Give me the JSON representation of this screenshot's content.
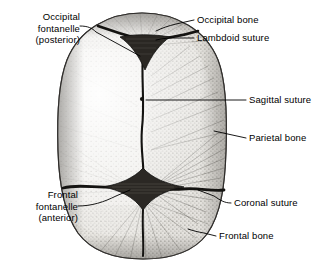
{
  "figure": {
    "name": "neonatal-skull-superior-view",
    "view": "superior",
    "background_color": "#ffffff",
    "ink_color": "#000000",
    "bone_fill": "#e8e6e2",
    "suture_color": "#111111"
  },
  "labels": [
    {
      "id": "occipital-fontanelle",
      "lines": [
        "Occipital",
        "fontanelle",
        "(posterior)"
      ],
      "align": "right",
      "x": 8,
      "y": 12,
      "leader": "from text right edge to posterior fontanelle"
    },
    {
      "id": "occipital-bone",
      "lines": [
        "Occipital bone"
      ],
      "align": "left",
      "x": 196,
      "y": 14,
      "leader": "from text left edge to occipital bone surface"
    },
    {
      "id": "lambdoid-suture",
      "lines": [
        "Lambdoid suture"
      ],
      "align": "left",
      "x": 196,
      "y": 33,
      "leader": "from text left edge to lambdoid suture line"
    },
    {
      "id": "sagittal-suture",
      "lines": [
        "Sagittal suture"
      ],
      "align": "left",
      "x": 248,
      "y": 95,
      "leader": "horizontal to midline sagittal suture"
    },
    {
      "id": "parietal-bone",
      "lines": [
        "Parietal bone"
      ],
      "align": "left",
      "x": 248,
      "y": 133,
      "leader": "to right parietal bone surface"
    },
    {
      "id": "coronal-suture",
      "lines": [
        "Coronal suture"
      ],
      "align": "left",
      "x": 233,
      "y": 198,
      "leader": "to coronal suture line"
    },
    {
      "id": "frontal-bone",
      "lines": [
        "Frontal bone"
      ],
      "align": "left",
      "x": 218,
      "y": 231,
      "leader": "to frontal bone surface"
    },
    {
      "id": "frontal-fontanelle",
      "lines": [
        "Frontal",
        "fontanelle",
        "(anterior)"
      ],
      "align": "right",
      "x": 8,
      "y": 190,
      "leader": "from text right edge to anterior fontanelle"
    }
  ],
  "structures": [
    {
      "id": "occipital-bone",
      "type": "bone",
      "position": "posterior (top)"
    },
    {
      "id": "parietal-bone-left",
      "type": "bone",
      "position": "left lateral"
    },
    {
      "id": "parietal-bone-right",
      "type": "bone",
      "position": "right lateral"
    },
    {
      "id": "frontal-bone",
      "type": "bone",
      "position": "anterior (bottom)"
    },
    {
      "id": "lambdoid-suture",
      "type": "suture",
      "position": "posterior transverse"
    },
    {
      "id": "sagittal-suture",
      "type": "suture",
      "position": "midline longitudinal"
    },
    {
      "id": "coronal-suture",
      "type": "suture",
      "position": "anterior transverse"
    },
    {
      "id": "posterior-fontanelle",
      "type": "fontanelle",
      "shape": "triangular"
    },
    {
      "id": "anterior-fontanelle",
      "type": "fontanelle",
      "shape": "diamond"
    }
  ]
}
